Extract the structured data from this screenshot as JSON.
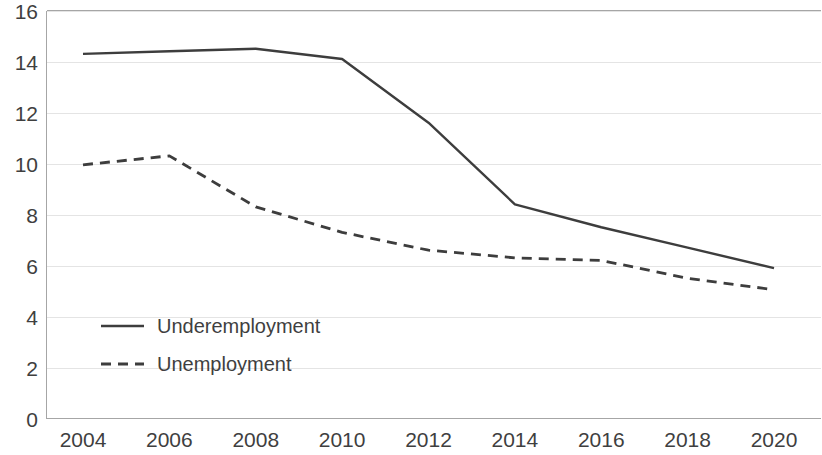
{
  "chart_data": {
    "type": "line",
    "title": "",
    "subtitle": "",
    "xlabel": "",
    "ylabel": "",
    "x": [
      2004,
      2005,
      2006,
      2007,
      2008,
      2009,
      2010,
      2011,
      2012,
      2013,
      2014,
      2015,
      2016,
      2017,
      2018,
      2019,
      2020
    ],
    "categories": [
      "2004",
      "2006",
      "2008",
      "2010",
      "2012",
      "2014",
      "2016",
      "2018",
      "2020"
    ],
    "xtick_labels": [
      "2004",
      "2006",
      "2008",
      "2010",
      "2012",
      "2014",
      "2016",
      "2018",
      "2020"
    ],
    "ytick_labels": [
      "0",
      "2",
      "4",
      "6",
      "8",
      "10",
      "12",
      "14",
      "16"
    ],
    "xlim": [
      2004,
      2020
    ],
    "ylim": [
      0,
      16
    ],
    "ytick_step": 2,
    "xtick_step": 2,
    "grid": "horizontal",
    "legend_position": "inside-lower-left",
    "series": [
      {
        "name": "Underemployment",
        "style": "solid",
        "color": "#3d3d3d",
        "x": [
          2004,
          2006,
          2008,
          2010,
          2012,
          2014,
          2016,
          2018,
          2020
        ],
        "values": [
          14.3,
          14.4,
          14.5,
          14.1,
          11.6,
          8.4,
          7.5,
          6.7,
          5.9
        ]
      },
      {
        "name": "Unemployment",
        "style": "dashed",
        "color": "#3d3d3d",
        "x": [
          2004,
          2006,
          2008,
          2010,
          2012,
          2014,
          2016,
          2018,
          2020
        ],
        "values": [
          9.95,
          10.3,
          8.3,
          7.3,
          6.6,
          6.3,
          6.2,
          5.5,
          5.05
        ]
      }
    ]
  },
  "legend": {
    "items": [
      {
        "label": "Underemployment",
        "style": "solid"
      },
      {
        "label": "Unemployment",
        "style": "dashed"
      }
    ]
  },
  "axes": {
    "y_ticks": [
      "16",
      "14",
      "12",
      "10",
      "8",
      "6",
      "4",
      "2",
      "0"
    ],
    "x_ticks": [
      "2004",
      "2006",
      "2008",
      "2010",
      "2012",
      "2014",
      "2016",
      "2018",
      "2020"
    ]
  },
  "colors": {
    "line": "#3d3d3d",
    "grid": "#e4e4e4",
    "axis": "#a6a6a6",
    "text": "#3f3f3f",
    "background": "#ffffff"
  }
}
